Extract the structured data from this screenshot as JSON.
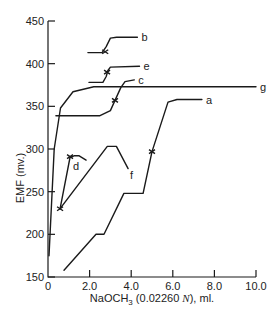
{
  "chart_data": {
    "type": "line",
    "title": "",
    "xlabel": "NaOCH3 (0.02260 N), ml.",
    "xlabel_parts": {
      "main": "NaOCH",
      "sub": "3",
      "rest1": " (0.02260 ",
      "italic": "N",
      "rest2": "), ml."
    },
    "ylabel": "EMF (mv.)",
    "xlim": [
      0,
      10.0
    ],
    "ylim": [
      150,
      450
    ],
    "x_ticks": [
      0,
      2.0,
      4.0,
      6.0,
      8.0,
      10.0
    ],
    "x_tick_labels": [
      "0",
      "2.0",
      "4.0",
      "6.0",
      "8.0",
      "10.0"
    ],
    "y_ticks": [
      150,
      200,
      250,
      300,
      350,
      400,
      450
    ],
    "y_tick_labels": [
      "150",
      "200",
      "250",
      "300",
      "350",
      "400",
      "450"
    ],
    "grid": false,
    "legend": "inline labels at curve ends",
    "series": [
      {
        "name": "a",
        "points": [
          [
            0.77,
            158
          ],
          [
            2.31,
            200
          ],
          [
            2.69,
            200
          ],
          [
            3.65,
            248
          ],
          [
            4.57,
            248
          ],
          [
            5.0,
            297
          ],
          [
            5.77,
            355
          ],
          [
            6.2,
            358
          ],
          [
            7.4,
            358
          ]
        ],
        "endpoint_marker": [
          5.0,
          297
        ]
      },
      {
        "name": "b",
        "points": [
          [
            1.92,
            413
          ],
          [
            2.6,
            413
          ],
          [
            2.8,
            420
          ],
          [
            3.0,
            430
          ],
          [
            3.3,
            431
          ],
          [
            4.3,
            431
          ]
        ],
        "endpoint_marker": [
          2.75,
          414
        ]
      },
      {
        "name": "c",
        "points": [
          [
            0.38,
            339
          ],
          [
            2.5,
            339
          ],
          [
            3.0,
            345
          ],
          [
            3.22,
            357
          ],
          [
            3.5,
            372
          ],
          [
            3.7,
            379
          ],
          [
            4.15,
            381
          ]
        ],
        "endpoint_marker": [
          3.22,
          357
        ]
      },
      {
        "name": "d",
        "points": [
          [
            0.58,
            230
          ],
          [
            1.06,
            290
          ],
          [
            1.25,
            292
          ],
          [
            1.5,
            292
          ],
          [
            1.83,
            287
          ]
        ],
        "endpoint_marker": [
          1.06,
          291
        ]
      },
      {
        "name": "e",
        "points": [
          [
            1.97,
            378
          ],
          [
            2.64,
            378
          ],
          [
            2.8,
            385
          ],
          [
            2.88,
            392
          ],
          [
            3.0,
            396
          ],
          [
            4.4,
            397
          ]
        ],
        "endpoint_marker": [
          2.84,
          390
        ]
      },
      {
        "name": "f",
        "points": [
          [
            0.58,
            230
          ],
          [
            2.85,
            303
          ],
          [
            3.29,
            303
          ],
          [
            3.85,
            277
          ]
        ],
        "endpoint_marker": [
          0.58,
          230
        ]
      },
      {
        "name": "g",
        "points": [
          [
            0.05,
            175
          ],
          [
            0.3,
            300
          ],
          [
            0.6,
            348
          ],
          [
            1.2,
            367
          ],
          [
            2.2,
            373
          ],
          [
            10.0,
            373
          ]
        ]
      }
    ]
  }
}
